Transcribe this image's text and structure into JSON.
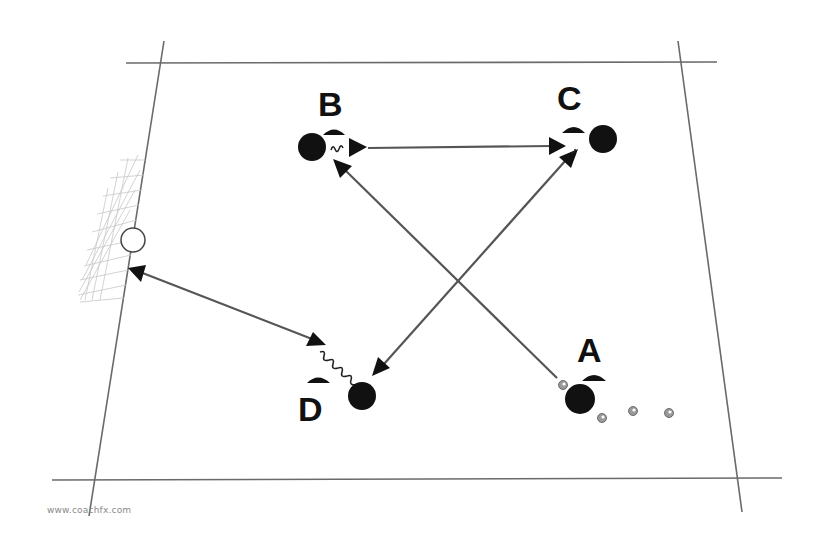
{
  "diagram": {
    "type": "soccer-drill",
    "players": [
      {
        "label": "A",
        "x": 580,
        "y": 399,
        "label_x": 593,
        "label_y": 362,
        "cone_x": 593,
        "cone_y": 377
      },
      {
        "label": "B",
        "x": 312,
        "y": 147,
        "label_x": 333,
        "label_y": 116,
        "cone_x": 334,
        "cone_y": 131
      },
      {
        "label": "C",
        "x": 603,
        "y": 139,
        "label_x": 574,
        "label_y": 110,
        "cone_x": 573,
        "cone_y": 128
      },
      {
        "label": "D",
        "x": 362,
        "y": 396,
        "label_x": 313,
        "label_y": 420,
        "cone_x": 318,
        "cone_y": 380
      }
    ],
    "passes": [
      {
        "from": "A",
        "to": "B",
        "style": "arrow"
      },
      {
        "from": "B",
        "to": "C",
        "style": "arrow"
      },
      {
        "from": "C",
        "to": "D",
        "style": "double-arrow"
      },
      {
        "from": "D",
        "to": "Goal",
        "style": "double-arrow"
      }
    ],
    "dribbles": [
      {
        "at": "B"
      },
      {
        "at": "C"
      },
      {
        "at": "D"
      }
    ],
    "balls_count": 4,
    "goal": {
      "type": "goal-with-net",
      "position": "left"
    }
  },
  "labels": {
    "a": "A",
    "b": "B",
    "c": "C",
    "d": "D"
  },
  "watermark": "www.coachfx.com"
}
